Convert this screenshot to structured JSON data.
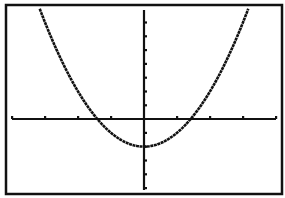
{
  "screen": {
    "type": "graphing-calculator-display",
    "background": "#ffffff",
    "ink": "#111111"
  },
  "chart_data": {
    "type": "line",
    "title": "",
    "function": "y = x^2 - 2",
    "xlabel": "",
    "ylabel": "",
    "xlim": [
      -4,
      4
    ],
    "ylim": [
      -5,
      8
    ],
    "xscl": 1,
    "yscl": 1,
    "grid": false,
    "legend": null,
    "axes": true,
    "x_ticks": [
      -4,
      -3,
      -2,
      -1,
      1,
      2,
      3,
      4
    ],
    "y_ticks": [
      -5,
      -4,
      -3,
      -2,
      -1,
      1,
      2,
      3,
      4,
      5,
      6,
      7,
      8
    ],
    "series": [
      {
        "name": "Y1",
        "x": [
          -3.16,
          -3,
          -2.5,
          -2,
          -1.5,
          -1.41,
          -1,
          -0.5,
          0,
          0.5,
          1,
          1.41,
          1.5,
          2,
          2.5,
          3,
          3.16
        ],
        "y": [
          8,
          7,
          4.25,
          2,
          0.25,
          0,
          -1,
          -1.75,
          -2,
          -1.75,
          -1,
          0,
          0.25,
          2,
          4.25,
          7,
          8
        ]
      }
    ],
    "key_points": {
      "vertex": [
        0,
        -2
      ],
      "x_intercepts": [
        -1.41,
        1.41
      ],
      "y_intercept": -2
    }
  }
}
